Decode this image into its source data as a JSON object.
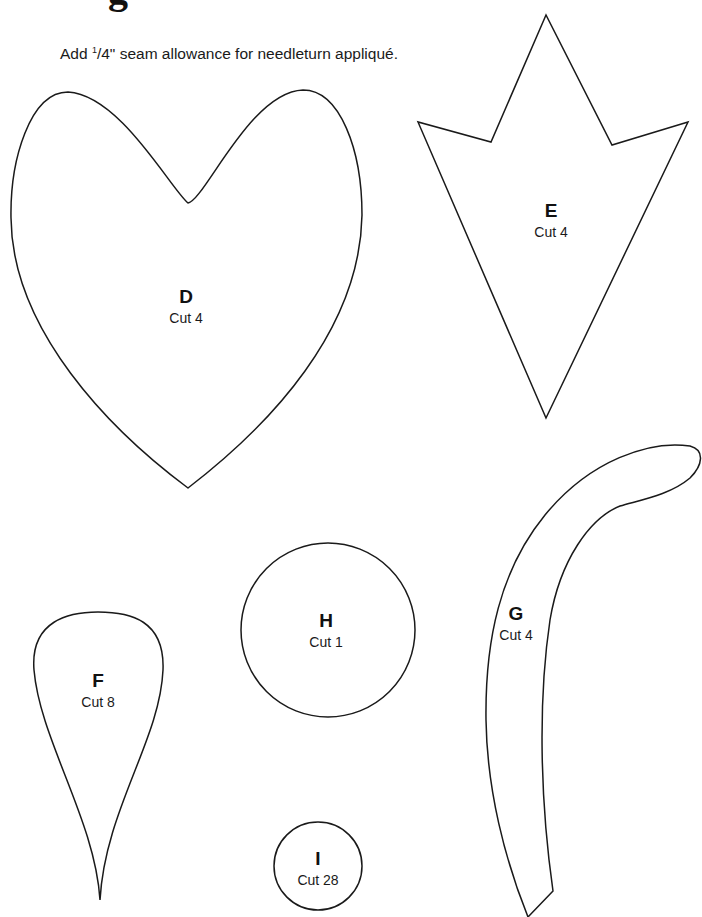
{
  "heading_fragment": "g",
  "instruction": {
    "prefix": "Add ",
    "fraction_numerator": "1",
    "fraction_rest": "/4\"",
    "suffix": " seam allowance for needleturn appliqué."
  },
  "pieces": [
    {
      "id": "D",
      "letter": "D",
      "cut": "Cut 4",
      "shape": "heart"
    },
    {
      "id": "E",
      "letter": "E",
      "cut": "Cut 4",
      "shape": "pointed-leaf"
    },
    {
      "id": "F",
      "letter": "F",
      "cut": "Cut 8",
      "shape": "teardrop-petal"
    },
    {
      "id": "G",
      "letter": "G",
      "cut": "Cut 4",
      "shape": "curved-stem"
    },
    {
      "id": "H",
      "letter": "H",
      "cut": "Cut 1",
      "shape": "circle"
    },
    {
      "id": "I",
      "letter": "I",
      "cut": "Cut 28",
      "shape": "small-circle"
    }
  ]
}
